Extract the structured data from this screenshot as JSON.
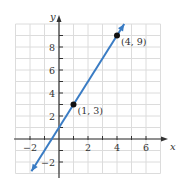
{
  "chart_data": {
    "type": "line",
    "title": "",
    "xlabel": "x",
    "ylabel": "y",
    "xlim": [
      -3,
      7
    ],
    "ylim": [
      -3,
      10
    ],
    "grid": true,
    "x_ticks": [
      -2,
      2,
      4,
      6
    ],
    "y_ticks": [
      -2,
      2,
      4,
      6,
      8
    ],
    "x_tick_labels": [
      "−2",
      "2",
      "4",
      "6"
    ],
    "y_tick_labels": [
      "−2",
      "2",
      "4",
      "6",
      "8"
    ],
    "series": [
      {
        "name": "line",
        "color": "#3a7cc4",
        "x": [
          -1.9,
          4.5
        ],
        "y": [
          -2.8,
          10.0
        ],
        "arrows": "both"
      }
    ],
    "points": [
      {
        "x": 1,
        "y": 3,
        "label": "(1, 3)"
      },
      {
        "x": 4,
        "y": 9,
        "label": "(4, 9)"
      }
    ]
  },
  "colors": {
    "grid": "#dcdcdc",
    "axis": "#333333",
    "line": "#3a7cc4",
    "point": "#111111"
  }
}
